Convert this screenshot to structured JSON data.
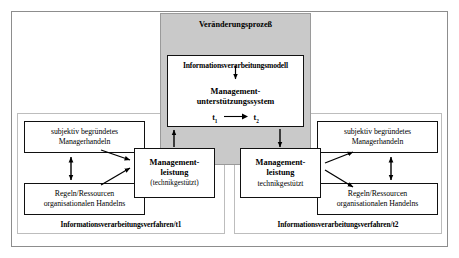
{
  "diagram": {
    "title": "Veränderungsprozeß",
    "change_process": {
      "header": "Veränderungsprozeß",
      "model_box": {
        "line1": "Informationsverarbeitungsmodell",
        "line2a": "Management-",
        "line2b": "unterstützungssystem",
        "time_from": "t",
        "time_from_sub": "1",
        "time_to": "t",
        "time_to_sub": "2"
      }
    },
    "left_panel": {
      "label": "Informationsverarbeitungsverfahren/t1",
      "subjective_box": {
        "line1": "subjektiv begründetes",
        "line2": "Managerhandeln"
      },
      "rules_box": {
        "line1": "Regeln/Ressourcen",
        "line2": "organisationalen Handelns"
      },
      "management_box": {
        "line1": "Management-",
        "line2": "leistung",
        "line3": "(technikgestützt)"
      }
    },
    "right_panel": {
      "label": "Informationsverarbeitungsverfahren/t2",
      "subjective_box": {
        "line1": "subjektiv begründetes",
        "line2": "Managerhandeln"
      },
      "rules_box": {
        "line1": "Regeln/Ressourcen",
        "line2": "organisationalen Handelns"
      },
      "management_box": {
        "line1": "Management-",
        "line2": "leistung",
        "line3": "technikgestützt"
      }
    },
    "colors": {
      "shaded_fill": "#c9c9c9",
      "shaded_border": "#9a9a9a",
      "box_border": "#111111",
      "panel_border": "#bdbdbd",
      "outer_border": "#8d8d8d",
      "background": "#ffffff",
      "text": "#000000"
    },
    "arrows": {
      "model_to_system": "down-arrow",
      "t1_to_t2": "right-arrow",
      "left_mgmt_to_process": "up-arrow",
      "process_to_right_mgmt": "down-arrow",
      "left_vertical": "double-headed-vertical-arrow",
      "right_vertical": "double-headed-vertical-arrow",
      "left_diagonals": "two-converging-arrows",
      "right_diagonals": "two-diverging-arrows"
    }
  }
}
